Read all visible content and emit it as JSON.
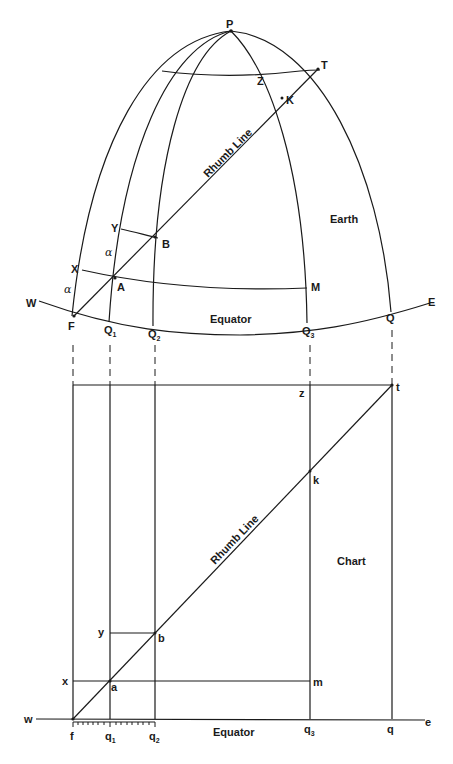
{
  "figure": {
    "earth": {
      "title": "Earth",
      "rhumb_label": "Rhumb Line",
      "equator_label": "Equator",
      "points": {
        "P": "P",
        "T": "T",
        "Z": "Z",
        "K": "K",
        "Y": "Y",
        "B": "B",
        "X": "X",
        "A": "A",
        "M": "M",
        "W": "W",
        "E": "E",
        "F": "F",
        "Q1": "Q",
        "Q1_sub": "1",
        "Q2": "Q",
        "Q2_sub": "2",
        "Q3": "Q",
        "Q3_sub": "3",
        "Q": "Q"
      },
      "angle_label_1": "α",
      "angle_label_2": "α"
    },
    "chart": {
      "title": "Chart",
      "rhumb_label": "Rhumb Line",
      "equator_label": "Equator",
      "points": {
        "z": "z",
        "t": "t",
        "k": "k",
        "y": "y",
        "b": "b",
        "x": "x",
        "a": "a",
        "m": "m",
        "w": "w",
        "e": "e",
        "f": "f",
        "q1": "q",
        "q1_sub": "1",
        "q2": "q",
        "q2_sub": "2",
        "q3": "q",
        "q3_sub": "3",
        "q": "q"
      }
    }
  }
}
